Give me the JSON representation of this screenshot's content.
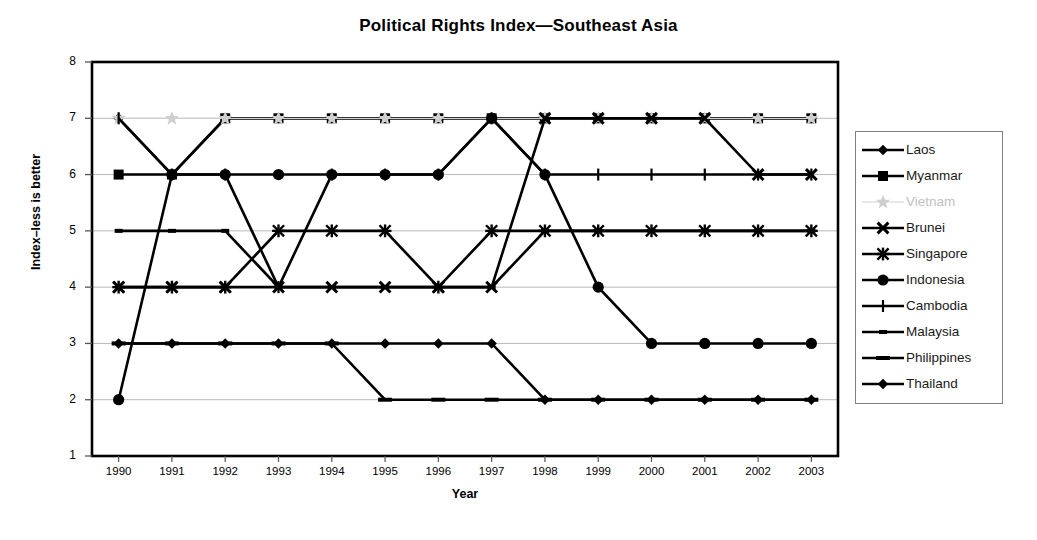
{
  "chart_data": {
    "type": "line",
    "title": "Political Rights Index—Southeast Asia",
    "xlabel": "Year",
    "ylabel": "Index–less is better",
    "x": [
      1990,
      1991,
      1992,
      1993,
      1994,
      1995,
      1996,
      1997,
      1998,
      1999,
      2000,
      2001,
      2002,
      2003
    ],
    "xtick_labels": [
      "1990",
      "1991",
      "1992",
      "1993",
      "1994",
      "1995",
      "1996",
      "1997",
      "1998",
      "1999",
      "2000",
      "2001",
      "2002",
      "2003"
    ],
    "ylim": [
      1,
      8
    ],
    "ytick_labels": [
      "1",
      "2",
      "3",
      "4",
      "5",
      "6",
      "7",
      "8"
    ],
    "grid": "horizontal",
    "legend_position": "right",
    "series": [
      {
        "name": "Laos",
        "marker": "diamond",
        "color": "#000000",
        "values": [
          7,
          6,
          7,
          7,
          7,
          7,
          7,
          7,
          7,
          7,
          7,
          7,
          7,
          7
        ]
      },
      {
        "name": "Myanmar",
        "marker": "square",
        "color": "#000000",
        "values": [
          6,
          6,
          7,
          7,
          7,
          7,
          7,
          7,
          7,
          7,
          7,
          7,
          7,
          7
        ]
      },
      {
        "name": "Vietnam",
        "marker": "star-light",
        "color": "#cfcfcf",
        "values": [
          7,
          7,
          7,
          7,
          7,
          7,
          7,
          7,
          7,
          7,
          7,
          7,
          7,
          7
        ]
      },
      {
        "name": "Brunei",
        "marker": "x",
        "color": "#000000",
        "values": [
          4,
          4,
          4,
          4,
          4,
          4,
          4,
          4,
          7,
          7,
          7,
          7,
          6,
          6
        ]
      },
      {
        "name": "Singapore",
        "marker": "asterisk",
        "color": "#000000",
        "values": [
          4,
          4,
          4,
          5,
          5,
          5,
          4,
          5,
          5,
          5,
          5,
          5,
          5,
          5
        ]
      },
      {
        "name": "Indonesia",
        "marker": "circle",
        "color": "#000000",
        "values": [
          2,
          6,
          6,
          6,
          6,
          6,
          6,
          7,
          6,
          4,
          3,
          3,
          3,
          3
        ]
      },
      {
        "name": "Cambodia",
        "marker": "plus",
        "color": "#000000",
        "values": [
          7,
          6,
          6,
          4,
          6,
          6,
          6,
          7,
          6,
          6,
          6,
          6,
          6,
          6
        ]
      },
      {
        "name": "Malaysia",
        "marker": "dash-small",
        "color": "#000000",
        "values": [
          5,
          5,
          5,
          4,
          4,
          4,
          4,
          4,
          5,
          5,
          5,
          5,
          5,
          5
        ]
      },
      {
        "name": "Philippines",
        "marker": "dash",
        "color": "#000000",
        "values": [
          3,
          3,
          3,
          3,
          3,
          2,
          2,
          2,
          2,
          2,
          2,
          2,
          2,
          2
        ]
      },
      {
        "name": "Thailand",
        "marker": "diamond",
        "color": "#000000",
        "values": [
          3,
          3,
          3,
          3,
          3,
          3,
          3,
          3,
          2,
          2,
          2,
          2,
          2,
          2
        ]
      }
    ]
  },
  "legend": {
    "items": [
      {
        "label": "Laos"
      },
      {
        "label": "Myanmar"
      },
      {
        "label": "Vietnam"
      },
      {
        "label": "Brunei"
      },
      {
        "label": "Singapore"
      },
      {
        "label": "Indonesia"
      },
      {
        "label": "Cambodia"
      },
      {
        "label": "Malaysia"
      },
      {
        "label": "Philippines"
      },
      {
        "label": "Thailand"
      }
    ]
  }
}
